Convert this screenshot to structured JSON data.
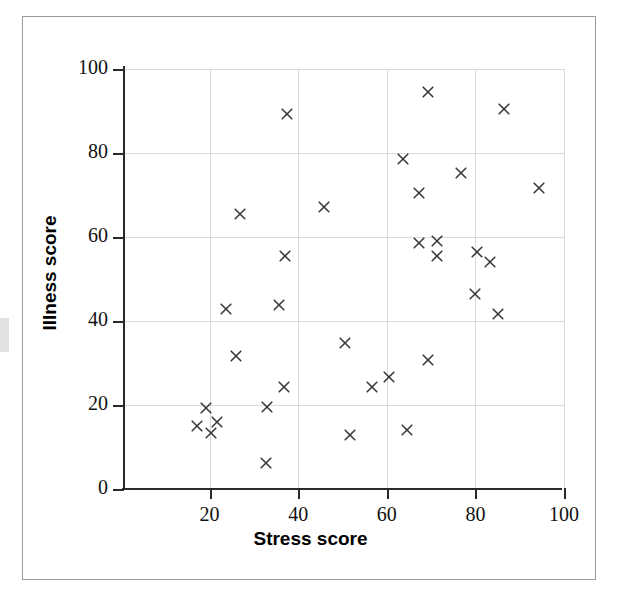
{
  "chart_data": {
    "type": "scatter",
    "title": "",
    "xlabel": "Stress score",
    "ylabel": "Illness score",
    "xlim": [
      0,
      100
    ],
    "ylim": [
      0,
      100
    ],
    "xticks": [
      20,
      40,
      60,
      80,
      100
    ],
    "yticks": [
      0,
      20,
      40,
      60,
      80,
      100
    ],
    "grid": true,
    "legend": "none",
    "marker": "x",
    "marker_color": "#3a3a3a",
    "points": [
      {
        "x": 17.2,
        "y": 14.9
      },
      {
        "x": 19.2,
        "y": 19.3
      },
      {
        "x": 20.3,
        "y": 13.3
      },
      {
        "x": 21.7,
        "y": 16.0
      },
      {
        "x": 23.6,
        "y": 42.9
      },
      {
        "x": 26.0,
        "y": 31.5
      },
      {
        "x": 26.8,
        "y": 65.4
      },
      {
        "x": 32.7,
        "y": 6.2
      },
      {
        "x": 33.0,
        "y": 19.5
      },
      {
        "x": 35.7,
        "y": 43.8
      },
      {
        "x": 36.9,
        "y": 24.2
      },
      {
        "x": 37.1,
        "y": 55.4
      },
      {
        "x": 37.4,
        "y": 89.2
      },
      {
        "x": 45.9,
        "y": 67.0
      },
      {
        "x": 50.6,
        "y": 34.8
      },
      {
        "x": 51.6,
        "y": 12.8
      },
      {
        "x": 56.6,
        "y": 24.3
      },
      {
        "x": 60.4,
        "y": 26.6
      },
      {
        "x": 63.6,
        "y": 78.6
      },
      {
        "x": 64.6,
        "y": 14.0
      },
      {
        "x": 67.2,
        "y": 58.6
      },
      {
        "x": 67.2,
        "y": 70.5
      },
      {
        "x": 69.2,
        "y": 30.6
      },
      {
        "x": 69.3,
        "y": 94.4
      },
      {
        "x": 71.3,
        "y": 58.9
      },
      {
        "x": 71.3,
        "y": 55.4
      },
      {
        "x": 76.8,
        "y": 75.1
      },
      {
        "x": 80.0,
        "y": 46.3
      },
      {
        "x": 80.3,
        "y": 56.3
      },
      {
        "x": 83.2,
        "y": 53.9
      },
      {
        "x": 85.2,
        "y": 41.6
      },
      {
        "x": 86.5,
        "y": 90.3
      },
      {
        "x": 94.4,
        "y": 71.5
      }
    ]
  },
  "axes": {
    "x_title": "Stress score",
    "y_title": "Illness score",
    "x_tick_labels": [
      "20",
      "40",
      "60",
      "80",
      "100"
    ],
    "y_tick_labels": [
      "0",
      "20",
      "40",
      "60",
      "80",
      "100"
    ]
  },
  "style": {
    "grid_color": "#d9d9d9",
    "axis_color": "#2a2a2a",
    "card_border_color": "#9a9a9a",
    "background": "#ffffff"
  }
}
